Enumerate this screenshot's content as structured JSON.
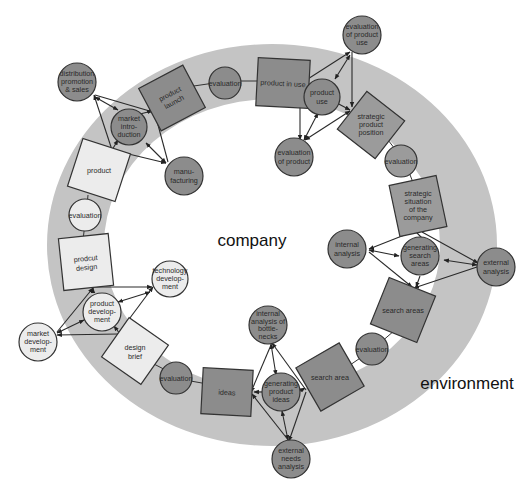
{
  "diagram": {
    "region_labels": {
      "inner": "company",
      "outer": "environment"
    },
    "colors": {
      "ring": "#c4c4c4",
      "dark_node": "#8c8c8c",
      "mid_node": "#9b9b9b",
      "light_node": "#ececec",
      "stroke": "#333333"
    },
    "ring_nodes": [
      {
        "id": "product-launch",
        "shape": "square",
        "lines": [
          "product",
          "launch"
        ]
      },
      {
        "id": "evaluation-1",
        "shape": "circle",
        "lines": [
          "evaluation"
        ]
      },
      {
        "id": "product-in-use",
        "shape": "square",
        "lines": [
          "product in use"
        ]
      },
      {
        "id": "strategic-product-position",
        "shape": "square",
        "lines": [
          "strategic",
          "product",
          "position"
        ]
      },
      {
        "id": "evaluation-2",
        "shape": "circle",
        "lines": [
          "evaluation"
        ]
      },
      {
        "id": "strategic-situation",
        "shape": "square",
        "lines": [
          "strategic",
          "situation",
          "of the",
          "company"
        ]
      },
      {
        "id": "search-areas-1",
        "shape": "square",
        "lines": [
          "search areas"
        ]
      },
      {
        "id": "evaluation-3",
        "shape": "circle",
        "lines": [
          "evaluation"
        ]
      },
      {
        "id": "search-area-2",
        "shape": "square",
        "lines": [
          "search area"
        ]
      },
      {
        "id": "ideas",
        "shape": "square",
        "lines": [
          "ideas"
        ]
      },
      {
        "id": "evaluation-4",
        "shape": "circle",
        "lines": [
          "evaluation"
        ]
      },
      {
        "id": "design-brief",
        "shape": "square",
        "lines": [
          "design",
          "brief"
        ]
      },
      {
        "id": "prodcut-design",
        "shape": "square",
        "lines": [
          "prodcut",
          "design"
        ]
      },
      {
        "id": "evaluation-5",
        "shape": "circle",
        "lines": [
          "evaluation"
        ]
      },
      {
        "id": "product",
        "shape": "square",
        "lines": [
          "product"
        ]
      }
    ],
    "satellite_nodes": [
      {
        "id": "distribution",
        "lines": [
          "distribution",
          "promotion",
          "& sales"
        ]
      },
      {
        "id": "market-introduction",
        "lines": [
          "market",
          "intro-",
          "duction"
        ]
      },
      {
        "id": "manufacturing",
        "lines": [
          "manu-",
          "facturing"
        ]
      },
      {
        "id": "evaluation-of-product-use",
        "lines": [
          "evaluation",
          "of product",
          "use"
        ]
      },
      {
        "id": "product-use",
        "lines": [
          "product",
          "use"
        ]
      },
      {
        "id": "evaluation-of-product",
        "lines": [
          "evaluation",
          "of product"
        ]
      },
      {
        "id": "internal-analysis",
        "lines": [
          "internal",
          "analysis"
        ]
      },
      {
        "id": "generating-search-areas",
        "lines": [
          "generating",
          "search",
          "areas"
        ]
      },
      {
        "id": "external-analysis",
        "lines": [
          "external",
          "analysis"
        ]
      },
      {
        "id": "internal-analysis-bottlenecks",
        "lines": [
          "internal",
          "analysis of",
          "bottle-",
          "necks"
        ]
      },
      {
        "id": "generating-product-ideas",
        "lines": [
          "generating",
          "product",
          "ideas"
        ]
      },
      {
        "id": "external-needs-analysis",
        "lines": [
          "external",
          "needs",
          "analysis"
        ]
      },
      {
        "id": "technology-development",
        "lines": [
          "technology",
          "develop-",
          "ment"
        ]
      },
      {
        "id": "product-development",
        "lines": [
          "product",
          "develop-",
          "ment"
        ]
      },
      {
        "id": "market-development",
        "lines": [
          "market",
          "develop-",
          "ment"
        ]
      }
    ]
  }
}
